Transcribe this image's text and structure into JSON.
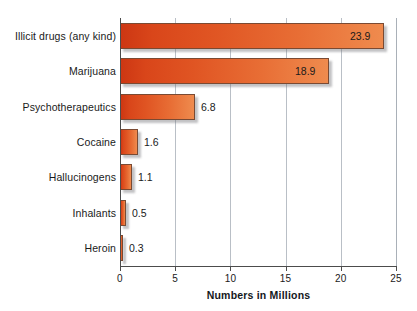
{
  "chart_data": {
    "type": "bar",
    "orientation": "horizontal",
    "title": "",
    "xlabel": "Numbers in Millions",
    "ylabel": "",
    "xlim": [
      0,
      25
    ],
    "xticks": [
      "0",
      "5",
      "10",
      "15",
      "20",
      "25"
    ],
    "xtick_values": [
      0,
      5,
      10,
      15,
      20,
      25
    ],
    "grid": "vertical",
    "legend": "none",
    "categories": [
      "Illicit drugs (any kind)",
      "Marijuana",
      "Psychotherapeutics",
      "Cocaine",
      "Hallucinogens",
      "Inhalants",
      "Heroin"
    ],
    "values": [
      23.9,
      18.9,
      6.8,
      1.6,
      1.1,
      0.5,
      0.3
    ],
    "data_labels": [
      "23.9",
      "18.9",
      "6.8",
      "1.6",
      "1.1",
      "0.5",
      "0.3"
    ],
    "label_placement": [
      "inside",
      "inside",
      "outside",
      "outside",
      "outside",
      "outside",
      "outside"
    ],
    "colors": {
      "bar_gradient_start": "#cd3713",
      "bar_gradient_end": "#ef8b4e",
      "bar_border": "#7a4a33",
      "grid": "#b9bfc6",
      "axis": "#4c4c4c",
      "text": "#1a1a1a",
      "background": "#ffffff"
    }
  },
  "rows": [
    {
      "label": "Illicit drugs (any kind)",
      "value": 23.9,
      "value_text": "23.9"
    },
    {
      "label": "Marijuana",
      "value": 18.9,
      "value_text": "18.9"
    },
    {
      "label": "Psychotherapeutics",
      "value": 6.8,
      "value_text": "6.8"
    },
    {
      "label": "Cocaine",
      "value": 1.6,
      "value_text": "1.6"
    },
    {
      "label": "Hallucinogens",
      "value": 1.1,
      "value_text": "1.1"
    },
    {
      "label": "Inhalants",
      "value": 0.5,
      "value_text": "0.5"
    },
    {
      "label": "Heroin",
      "value": 0.3,
      "value_text": "0.3"
    }
  ],
  "axis": {
    "title": "Numbers in Millions",
    "ticks": [
      "0",
      "5",
      "10",
      "15",
      "20",
      "25"
    ]
  }
}
